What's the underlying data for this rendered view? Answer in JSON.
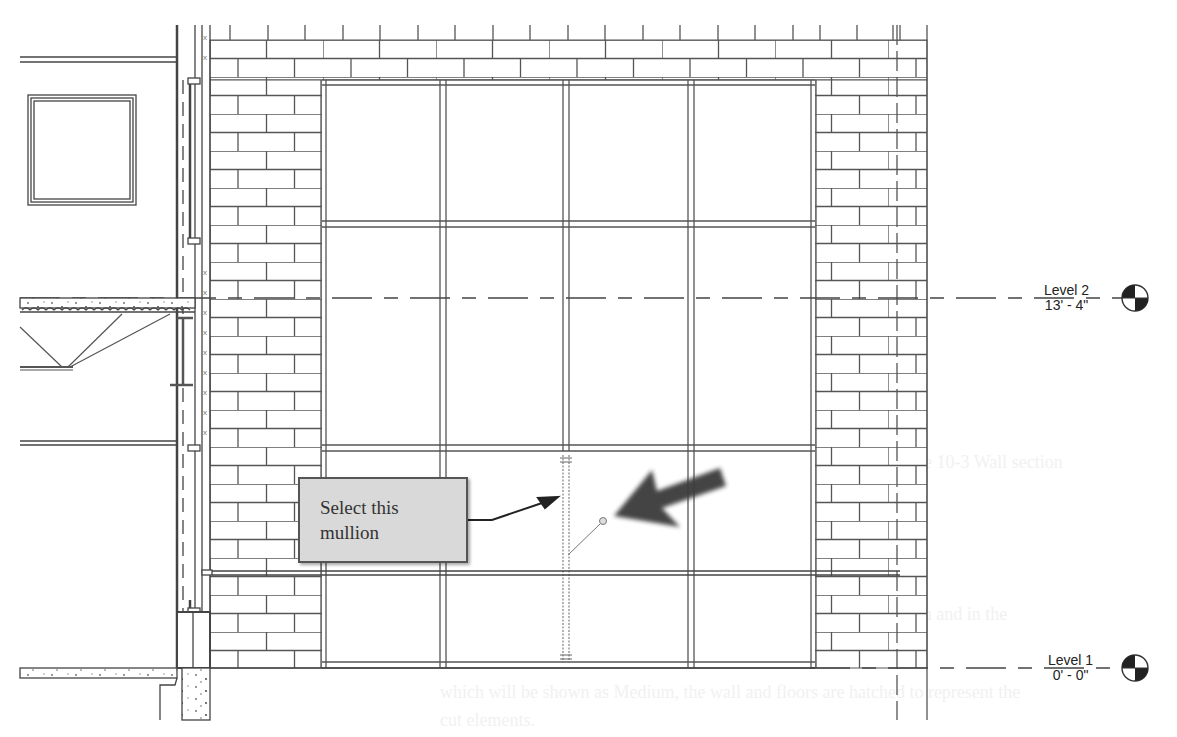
{
  "view": {
    "type": "Curtain wall elevation / wall section detail",
    "background": "#ffffff",
    "line_color": "#444444"
  },
  "levels": [
    {
      "name": "Level 2",
      "elevation": "13' - 4\"",
      "y": 298
    },
    {
      "name": "Level 1",
      "elevation": "0' - 0\"",
      "y": 668
    }
  ],
  "callout": {
    "text_line1": "Select this",
    "text_line2": "mullion",
    "fill": "#d9d9d9",
    "border": "#555555"
  },
  "annotation_arrow": {
    "color": "#3a3a3a",
    "points_to": "vertical mullion"
  },
  "curtain_wall": {
    "grid_x": [
      322,
      443,
      565,
      691,
      815
    ],
    "grid_y": [
      80,
      223,
      447,
      665
    ],
    "selected_mullion": {
      "x": 567,
      "y_top": 460,
      "y_bottom": 658
    }
  },
  "ghost_text": {
    "figure_caption": "Figure 10-3 Wall section",
    "line1": "them automatically display lower lines for objects that are in section and in the",
    "line2": "section cut plane in elevation.",
    "line3": "which will be shown as Medium, the wall and floors are hatched to represent the",
    "line4": "cut elements."
  }
}
